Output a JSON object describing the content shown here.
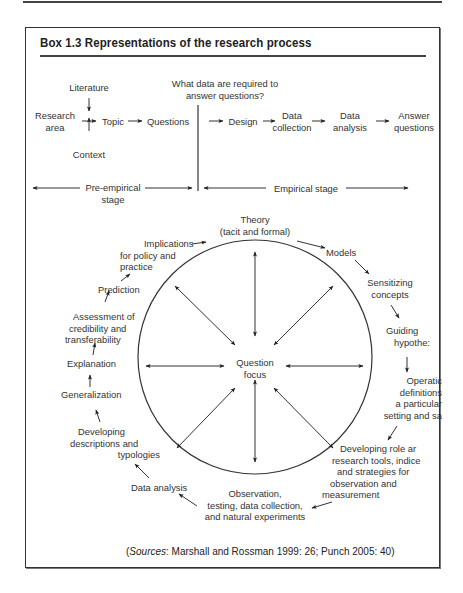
{
  "box": {
    "title": "Box 1.3  Representations of the research process"
  },
  "linear_model": {
    "question_note": [
      "What data are required to",
      "answer questions?"
    ],
    "inputs": {
      "literature": "Literature",
      "research_area": [
        "Research",
        "area"
      ],
      "context": "Context"
    },
    "steps": [
      {
        "id": "topic",
        "lines": [
          "Topic"
        ]
      },
      {
        "id": "questions",
        "lines": [
          "Questions"
        ]
      },
      {
        "id": "design",
        "lines": [
          "Design"
        ]
      },
      {
        "id": "data-collection",
        "lines": [
          "Data",
          "collection"
        ]
      },
      {
        "id": "data-analysis",
        "lines": [
          "Data",
          "analysis"
        ]
      },
      {
        "id": "answer-questions",
        "lines": [
          "Answer",
          "questions"
        ]
      }
    ],
    "stages": {
      "pre_empirical": [
        "Pre-empirical",
        "stage"
      ],
      "empirical": "Empirical stage"
    }
  },
  "cycle_model": {
    "center": [
      "Question",
      "focus"
    ],
    "nodes": [
      {
        "id": "theory",
        "lines": [
          "Theory",
          "(tacit and formal)"
        ]
      },
      {
        "id": "models",
        "lines": [
          "Models"
        ]
      },
      {
        "id": "sensitizing-concepts",
        "lines": [
          "Sensitizing",
          "concepts"
        ]
      },
      {
        "id": "guiding-hypotheses",
        "lines": [
          "Guiding",
          "hypothe:"
        ]
      },
      {
        "id": "operational-definitions",
        "lines": [
          "Operatic",
          "definitions",
          "a particular",
          "setting and sa"
        ]
      },
      {
        "id": "developing-role",
        "lines": [
          "Developing role ar",
          "research tools, indice",
          "and strategies for",
          "observation and",
          "measurement"
        ]
      },
      {
        "id": "observation",
        "lines": [
          "Observation,",
          "testing, data collection,",
          "and natural experiments"
        ]
      },
      {
        "id": "data-analysis",
        "lines": [
          "Data analysis"
        ]
      },
      {
        "id": "descriptions",
        "lines": [
          "Developing",
          "descriptions and",
          "typologies"
        ]
      },
      {
        "id": "generalization",
        "lines": [
          "Generalization"
        ]
      },
      {
        "id": "explanation",
        "lines": [
          "Explanation"
        ]
      },
      {
        "id": "assessment",
        "lines": [
          "Assessment of",
          "credibility and",
          "transferability"
        ]
      },
      {
        "id": "prediction",
        "lines": [
          "Prediction"
        ]
      },
      {
        "id": "implications",
        "lines": [
          "Implications",
          "for policy and",
          "practice"
        ]
      }
    ]
  },
  "sources": {
    "open": "(",
    "label": "Sources",
    "text": ": Marshall and Rossman 1999: 26; Punch 2005: 40)"
  },
  "colors": {
    "ink": "#333333",
    "border": "#333333"
  }
}
